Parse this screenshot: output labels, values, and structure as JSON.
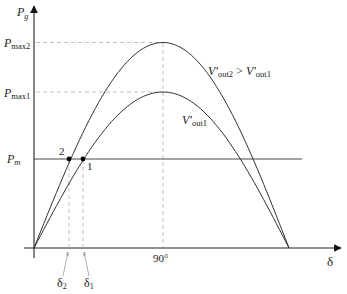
{
  "diagram": {
    "axes": {
      "y_label_main": "P",
      "y_label_sub": "g",
      "x_label": "δ"
    },
    "y_ticks": [
      {
        "main": "P",
        "sub": "max2"
      },
      {
        "main": "P",
        "sub": "max1"
      },
      {
        "main": "P",
        "sub": "m"
      }
    ],
    "x_ticks": [
      {
        "main": "δ",
        "sub": "2"
      },
      {
        "main": "δ",
        "sub": "1"
      },
      {
        "label": "90°"
      }
    ],
    "curve_labels": {
      "upper": {
        "v": "V′",
        "sub1": "out2",
        "op": " > ",
        "v2": "V′",
        "sub2": "out1"
      },
      "lower": {
        "v": "V′",
        "sub": "out1"
      }
    },
    "points": [
      {
        "label": "2"
      },
      {
        "label": "1"
      }
    ]
  },
  "chart_data": {
    "type": "line",
    "title": "",
    "xlabel": "δ",
    "ylabel": "P_g",
    "x_ticks": [
      "δ2",
      "δ1",
      "90°"
    ],
    "y_ticks": [
      "P_max2",
      "P_max1",
      "P_m"
    ],
    "series": [
      {
        "name": "V′out2 > V′out1",
        "shape": "sine",
        "peak_at": "90°",
        "peak": "P_max2",
        "relative_peak": 1.32
      },
      {
        "name": "V′out1",
        "shape": "sine",
        "peak_at": "90°",
        "peak": "P_max1",
        "relative_peak": 1.0
      },
      {
        "name": "P_m",
        "shape": "horizontal",
        "value": "P_m",
        "relative_value": 0.57
      }
    ],
    "intersections": [
      {
        "label": "2",
        "curve": "V′out2",
        "delta": "δ2"
      },
      {
        "label": "1",
        "curve": "V′out1",
        "delta": "δ1"
      }
    ],
    "grid": false
  }
}
